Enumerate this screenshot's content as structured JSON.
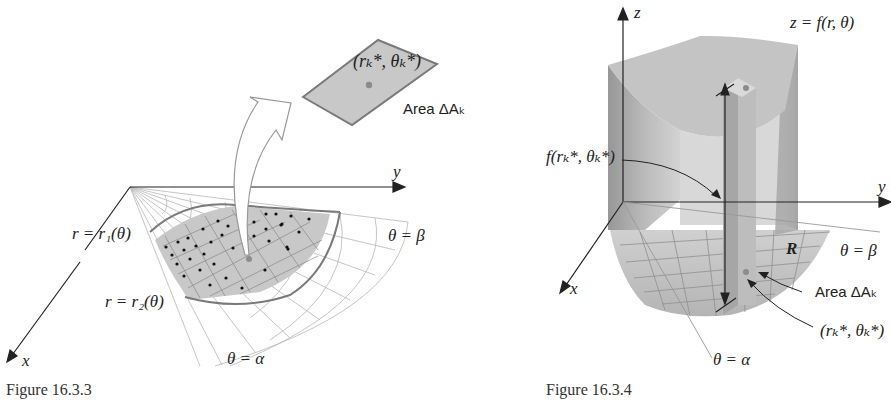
{
  "figures": [
    {
      "caption": "Figure 16.3.3",
      "axes": {
        "x_label": "x",
        "y_label": "y"
      },
      "labels": {
        "inner_curve": "r = r₁(θ)",
        "outer_curve": "r = r₂(θ)",
        "ray_beta": "θ = β",
        "ray_alpha": "θ = α",
        "sample_point": "(rₖ*, θₖ*)",
        "area": "Area ΔAₖ"
      }
    },
    {
      "caption": "Figure 16.3.4",
      "axes": {
        "x_label": "x",
        "y_label": "y",
        "z_label": "z"
      },
      "labels": {
        "surface": "z = f(r, θ)",
        "height": "f(rₖ*, θₖ*)",
        "region": "R",
        "ray_beta": "θ = β",
        "ray_alpha": "θ = α",
        "area": "Area ΔAₖ",
        "sample_point": "(rₖ*, θₖ*)"
      }
    }
  ],
  "colors": {
    "region_fill": "#c8c8c8",
    "boundary_stroke": "#7a7a7a",
    "grid_stroke": "#b0b0b0",
    "sample_dot": "#8c8c8c",
    "axis": "#222222",
    "solid_fill": "#a8a8a8"
  }
}
